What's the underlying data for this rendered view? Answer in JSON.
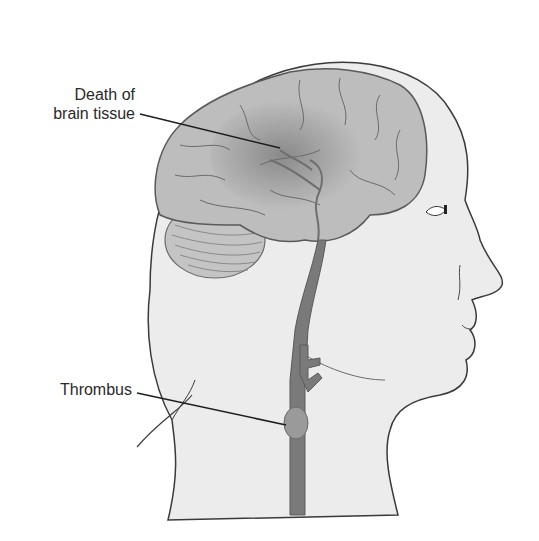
{
  "diagram": {
    "labels": {
      "death_line1": "Death of",
      "death_line2": "brain tissue",
      "thrombus": "Thrombus"
    },
    "colors": {
      "background": "#ffffff",
      "head_fill": "#ececec",
      "outline": "#3a3a3a",
      "brain_fill": "#bdbdbd",
      "brain_dark": "#8f8f8f",
      "artery": "#7a7a7a",
      "thrombus": "#9a9a9a",
      "leader_line": "#1e1e1e"
    }
  }
}
